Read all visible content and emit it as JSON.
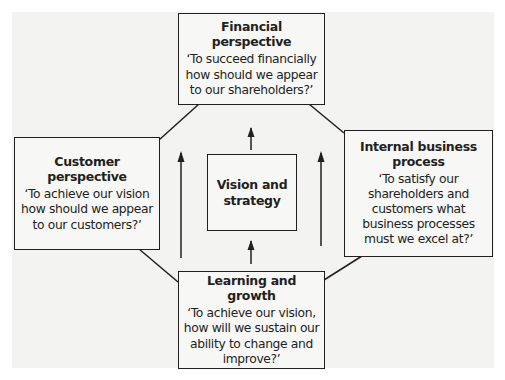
{
  "diagram": {
    "type": "balanced-scorecard",
    "nodes": {
      "financial": {
        "title": "Financial perspective",
        "question": "‘To succeed financially how should we appear to our shareholders?’"
      },
      "customer": {
        "title": "Customer perspective",
        "question": "‘To achieve our vision how should we appear to our customers?’"
      },
      "internal": {
        "title": "Internal business process",
        "question": "‘To satisfy our shareholders and customers what business processes must we excel at?’"
      },
      "learning": {
        "title": "Learning and growth",
        "question": "‘To achieve our vision, how will we sustain our ability to change and improve?’"
      },
      "vision": {
        "title": "Vision and strategy"
      }
    },
    "edges": [
      {
        "from": "financial",
        "to": "customer",
        "kind": "line"
      },
      {
        "from": "financial",
        "to": "internal",
        "kind": "line"
      },
      {
        "from": "customer",
        "to": "learning",
        "kind": "line"
      },
      {
        "from": "internal",
        "to": "learning",
        "kind": "line"
      },
      {
        "from": "learning",
        "to": "vision",
        "kind": "arrow-up"
      },
      {
        "from": "vision",
        "to": "financial",
        "kind": "arrow-up"
      },
      {
        "from": "learning-left",
        "to": "financial-left",
        "kind": "arrow-up"
      },
      {
        "from": "learning-right",
        "to": "financial-right",
        "kind": "arrow-up"
      }
    ],
    "colors": {
      "line": "#231f20",
      "box_fill": "#f7f7f6",
      "background_panel": "#f3f3f2"
    }
  }
}
